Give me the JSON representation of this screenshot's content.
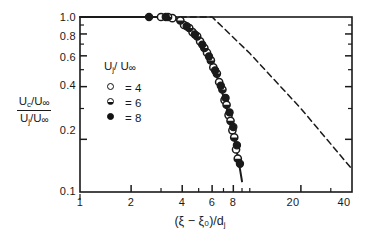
{
  "figure": {
    "type": "scientific-plot",
    "background": "#ffffff",
    "ink_color": "#1a1a1a"
  },
  "axes": {
    "x": {
      "label": "(ξ − ξ₀)/d",
      "label_sub": "j",
      "scale": "log",
      "range": [
        1,
        40
      ],
      "ticks": [
        1,
        2,
        4,
        6,
        8,
        20,
        40
      ],
      "tick_labels": [
        "1",
        "2",
        "4",
        "6",
        "8",
        "20",
        "40"
      ],
      "minor_ticks": [
        3,
        5,
        7,
        9,
        10,
        30
      ]
    },
    "y": {
      "label_numerator": "U",
      "label_numerator_sub": "c",
      "label_numerator_den": "U",
      "label_denominator": "U",
      "label_denominator_sub": "j",
      "scale": "log",
      "range": [
        0.1,
        1.0
      ],
      "ticks": [
        1.0,
        0.8,
        0.6,
        0.4,
        0.2,
        0.1
      ],
      "tick_labels": [
        "1.0",
        "0.8",
        "0.6",
        "0.4",
        "0.2",
        "0.1"
      ],
      "minor_ticks": [
        0.9,
        0.7,
        0.5,
        0.3
      ]
    },
    "frame": "box",
    "grid": false
  },
  "legend": {
    "title": "U",
    "title_sub": "j",
    "title_mid": "/ U",
    "title_inf": "∞",
    "position": "inside-left",
    "entries": [
      {
        "marker": "open-circle",
        "separator": "=",
        "value": "4"
      },
      {
        "marker": "half-circle",
        "separator": "=",
        "value": "6"
      },
      {
        "marker": "filled-circle",
        "separator": "=",
        "value": "8"
      }
    ]
  },
  "chart_data": {
    "type": "line",
    "title": "",
    "xlabel": "(ξ − ξ₀)/dj",
    "ylabel": "(Uc/U∞)/(Uj/U∞)",
    "xscale": "log",
    "yscale": "log",
    "xlim": [
      1,
      40
    ],
    "ylim": [
      0.1,
      1.0
    ],
    "grid": false,
    "legend_position": "inside-left",
    "series": [
      {
        "name": "data-curve-solid",
        "style": "solid",
        "comment": "measured centerline decay, flat at 1.0 then steep power-law fall",
        "x": [
          1.0,
          2.0,
          2.6,
          3.0,
          3.4,
          3.7,
          4.0,
          4.3,
          4.6,
          5.0,
          5.4,
          5.8,
          6.2,
          6.6,
          7.0,
          7.4,
          7.8,
          8.2,
          8.6,
          9.0
        ],
        "y": [
          1.0,
          1.0,
          1.0,
          1.0,
          0.99,
          0.97,
          0.93,
          0.88,
          0.82,
          0.74,
          0.66,
          0.58,
          0.5,
          0.42,
          0.35,
          0.29,
          0.235,
          0.19,
          0.15,
          0.115
        ]
      },
      {
        "name": "reference-dashed",
        "style": "dashed",
        "comment": "dashed reference: unity plateau to x=6 then -1 slope decay to x=40",
        "x": [
          3.4,
          6.0,
          10.0,
          20.0,
          40.0
        ],
        "y": [
          1.0,
          1.0,
          0.62,
          0.3,
          0.135
        ]
      }
    ],
    "markers": [
      {
        "series": "open-circle",
        "uj_uinf": 4,
        "x": [
          3.0,
          3.5,
          4.1,
          4.6,
          5.1,
          5.6,
          6.1,
          6.6,
          7.1,
          7.5,
          7.9,
          8.3
        ],
        "y": [
          1.0,
          0.985,
          0.9,
          0.82,
          0.725,
          0.625,
          0.515,
          0.425,
          0.335,
          0.275,
          0.225,
          0.175
        ]
      },
      {
        "series": "half-circle",
        "uj_uinf": 6,
        "x": [
          3.3,
          3.9,
          4.4,
          4.9,
          5.4,
          5.9,
          6.4,
          6.9,
          7.3,
          7.7,
          8.1,
          8.5
        ],
        "y": [
          1.0,
          0.955,
          0.865,
          0.775,
          0.665,
          0.565,
          0.475,
          0.385,
          0.315,
          0.255,
          0.205,
          0.155
        ]
      },
      {
        "series": "filled-circle",
        "uj_uinf": 8,
        "x": [
          2.55,
          3.2,
          4.25,
          4.75,
          5.25,
          5.75,
          6.25,
          6.75,
          7.2,
          7.6,
          8.0,
          8.4,
          8.75
        ],
        "y": [
          1.0,
          1.0,
          0.885,
          0.795,
          0.695,
          0.595,
          0.495,
          0.405,
          0.345,
          0.285,
          0.235,
          0.185,
          0.145
        ]
      }
    ]
  }
}
